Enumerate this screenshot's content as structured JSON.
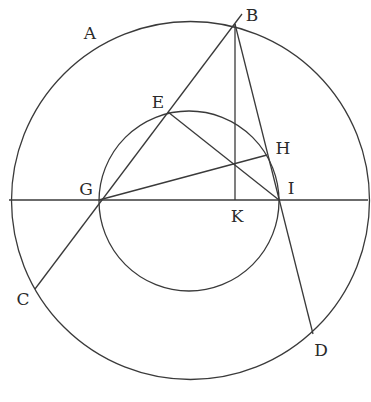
{
  "diagram": {
    "stroke_color": "#3a3a3a",
    "background": "#ffffff",
    "outer_circle": {
      "cx": 190.5,
      "cy": 200.5,
      "r": 179
    },
    "inner_circle": {
      "cx": 189,
      "cy": 201,
      "r": 90
    },
    "points": {
      "B": {
        "x": 235,
        "y": 24
      },
      "C": {
        "x": 35,
        "y": 289
      },
      "D": {
        "x": 313,
        "y": 334
      },
      "E": {
        "x": 168,
        "y": 112
      },
      "G": {
        "x": 99,
        "y": 200
      },
      "H": {
        "x": 267,
        "y": 155
      },
      "I": {
        "x": 279,
        "y": 200
      },
      "K": {
        "x": 235,
        "y": 200
      },
      "X": {
        "x": 235,
        "y": 164
      }
    },
    "segments": [
      {
        "name": "horizontal-diameter",
        "from": [
          9,
          200
        ],
        "to": [
          368,
          200
        ]
      },
      {
        "name": "line-C-G-E-B",
        "from": [
          35,
          289
        ],
        "to": [
          242,
          14
        ]
      },
      {
        "name": "line-B-I-D",
        "from": [
          235,
          24
        ],
        "to": [
          313,
          334
        ]
      },
      {
        "name": "line-B-K",
        "from": [
          235,
          24
        ],
        "to": [
          235,
          200
        ]
      },
      {
        "name": "line-E-I",
        "from": [
          168,
          112
        ],
        "to": [
          279,
          200
        ]
      },
      {
        "name": "line-G-H",
        "from": [
          99,
          200
        ],
        "to": [
          267,
          155
        ]
      }
    ],
    "labels": [
      {
        "id": "A",
        "text": "A",
        "x": 90,
        "y": 33
      },
      {
        "id": "B",
        "text": "B",
        "x": 252,
        "y": 15
      },
      {
        "id": "C",
        "text": "C",
        "x": 23,
        "y": 299
      },
      {
        "id": "D",
        "text": "D",
        "x": 321,
        "y": 350
      },
      {
        "id": "E",
        "text": "E",
        "x": 158,
        "y": 102
      },
      {
        "id": "G",
        "text": "G",
        "x": 86,
        "y": 189
      },
      {
        "id": "H",
        "text": "H",
        "x": 283,
        "y": 148
      },
      {
        "id": "I",
        "text": "I",
        "x": 291,
        "y": 188
      },
      {
        "id": "K",
        "text": "K",
        "x": 237,
        "y": 216
      }
    ]
  }
}
